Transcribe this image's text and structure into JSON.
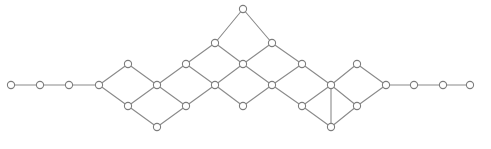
{
  "figure": {
    "width": 491,
    "height": 149,
    "background_color": "#ffffff",
    "edge_color": "#8a8a8a",
    "node_stroke_color": "#7d7d7d",
    "node_fill_color": "#ffffff",
    "node_radius": 3.6,
    "edge_width": 1.1
  },
  "chart_data": {
    "type": "scatter",
    "title": "",
    "xlabel": "",
    "ylabel": "",
    "grid": false,
    "legend": "none",
    "xlim": [
      0,
      491
    ],
    "ylim": [
      0,
      149
    ],
    "node_count": 39,
    "edge_count": 46,
    "nodes": [
      {
        "id": 0,
        "x": 11,
        "y": 85
      },
      {
        "id": 1,
        "x": 40,
        "y": 85
      },
      {
        "id": 2,
        "x": 69,
        "y": 85
      },
      {
        "id": 3,
        "x": 99,
        "y": 85
      },
      {
        "id": 4,
        "x": 128,
        "y": 64
      },
      {
        "id": 5,
        "x": 128,
        "y": 106
      },
      {
        "id": 6,
        "x": 157,
        "y": 85
      },
      {
        "id": 7,
        "x": 157,
        "y": 127
      },
      {
        "id": 8,
        "x": 186,
        "y": 64
      },
      {
        "id": 9,
        "x": 186,
        "y": 106
      },
      {
        "id": 10,
        "x": 215,
        "y": 43
      },
      {
        "id": 11,
        "x": 215,
        "y": 85
      },
      {
        "id": 12,
        "x": 243,
        "y": 9
      },
      {
        "id": 13,
        "x": 243,
        "y": 64
      },
      {
        "id": 14,
        "x": 243,
        "y": 106
      },
      {
        "id": 15,
        "x": 272,
        "y": 43
      },
      {
        "id": 16,
        "x": 272,
        "y": 85
      },
      {
        "id": 17,
        "x": 302,
        "y": 64
      },
      {
        "id": 18,
        "x": 302,
        "y": 106
      },
      {
        "id": 19,
        "x": 331,
        "y": 85
      },
      {
        "id": 20,
        "x": 331,
        "y": 127
      },
      {
        "id": 21,
        "x": 357,
        "y": 64
      },
      {
        "id": 22,
        "x": 357,
        "y": 106
      },
      {
        "id": 23,
        "x": 386,
        "y": 85
      },
      {
        "id": 24,
        "x": 414,
        "y": 85
      },
      {
        "id": 25,
        "x": 443,
        "y": 85
      },
      {
        "id": 26,
        "x": 470,
        "y": 85
      }
    ],
    "edges": [
      [
        0,
        1
      ],
      [
        1,
        2
      ],
      [
        2,
        3
      ],
      [
        3,
        4
      ],
      [
        3,
        5
      ],
      [
        4,
        6
      ],
      [
        5,
        6
      ],
      [
        5,
        7
      ],
      [
        6,
        8
      ],
      [
        6,
        9
      ],
      [
        7,
        9
      ],
      [
        8,
        10
      ],
      [
        8,
        11
      ],
      [
        9,
        11
      ],
      [
        10,
        12
      ],
      [
        10,
        13
      ],
      [
        11,
        13
      ],
      [
        11,
        14
      ],
      [
        12,
        15
      ],
      [
        13,
        15
      ],
      [
        13,
        16
      ],
      [
        14,
        16
      ],
      [
        15,
        17
      ],
      [
        16,
        17
      ],
      [
        16,
        18
      ],
      [
        17,
        19
      ],
      [
        18,
        19
      ],
      [
        19,
        21
      ],
      [
        19,
        20
      ],
      [
        20,
        22
      ],
      [
        21,
        23
      ],
      [
        22,
        23
      ],
      [
        23,
        24
      ],
      [
        24,
        25
      ],
      [
        25,
        26
      ],
      [
        19,
        22
      ],
      [
        18,
        20
      ]
    ]
  }
}
